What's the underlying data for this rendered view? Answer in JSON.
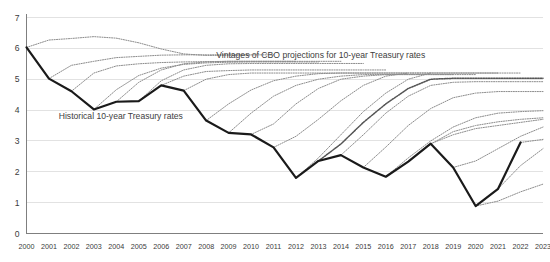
{
  "chart_data": {
    "type": "line",
    "title": "",
    "xlabel": "",
    "ylabel": "",
    "grid": true,
    "legend_position": "inline-annotations",
    "xlim": [
      2000,
      2023
    ],
    "ylim": [
      0,
      7
    ],
    "yticks": [
      0,
      1,
      2,
      3,
      4,
      5,
      6,
      7
    ],
    "ytick_labels": [
      "0",
      "1",
      "2",
      "3",
      "4",
      "5",
      "6",
      "7"
    ],
    "categories": [
      2000,
      2001,
      2002,
      2003,
      2004,
      2005,
      2006,
      2007,
      2008,
      2009,
      2010,
      2011,
      2012,
      2013,
      2014,
      2015,
      2016,
      2017,
      2018,
      2019,
      2020,
      2021,
      2022,
      2023
    ],
    "xtick_labels": [
      "2000",
      "2001",
      "2002",
      "2003",
      "2004",
      "2005",
      "2006",
      "2007",
      "2008",
      "2009",
      "2010",
      "2011",
      "2012",
      "2013",
      "2014",
      "2015",
      "2016",
      "2017",
      "2018",
      "2019",
      "2020",
      "2021",
      "2022",
      "2023"
    ],
    "annotations": [
      {
        "name": "historical-label",
        "text": "Historical 10-year Treasury rates",
        "x": 2004.2,
        "y": 3.72
      },
      {
        "name": "projections-label",
        "text": "Vintages of CBO projections for 10-year Treasury rates",
        "x": 2013.1,
        "y": 5.68
      }
    ],
    "series": [
      {
        "name": "Historical 10-year Treasury rates",
        "style": "solid",
        "color": "#1a1a1a",
        "x": [
          2000,
          2001,
          2002,
          2003,
          2004,
          2005,
          2006,
          2007,
          2008,
          2009,
          2010,
          2011,
          2012,
          2013,
          2014,
          2015,
          2016,
          2017,
          2018,
          2019,
          2020,
          2021,
          2022
        ],
        "values": [
          6.03,
          5.02,
          4.61,
          4.02,
          4.27,
          4.29,
          4.8,
          4.63,
          3.66,
          3.26,
          3.21,
          2.79,
          1.8,
          2.35,
          2.54,
          2.14,
          1.84,
          2.33,
          2.91,
          2.14,
          0.89,
          1.45,
          2.95
        ]
      },
      {
        "name": "CBO projection vintage 2000",
        "style": "dotted",
        "x": [
          2000,
          2001,
          2002,
          2003,
          2004,
          2005,
          2006,
          2007,
          2008,
          2009,
          2010
        ],
        "values": [
          6.03,
          6.27,
          6.32,
          6.38,
          6.33,
          6.18,
          5.98,
          5.82,
          5.77,
          5.78,
          5.78
        ]
      },
      {
        "name": "CBO projection vintage 2001",
        "style": "dotted",
        "x": [
          2001,
          2002,
          2003,
          2004,
          2005,
          2006,
          2007,
          2008,
          2009,
          2010,
          2011
        ],
        "values": [
          5.02,
          5.45,
          5.58,
          5.7,
          5.74,
          5.78,
          5.79,
          5.79,
          5.79,
          5.79,
          5.79
        ]
      },
      {
        "name": "CBO projection vintage 2002",
        "style": "dotted",
        "x": [
          2002,
          2003,
          2004,
          2005,
          2006,
          2007,
          2008,
          2009,
          2010,
          2011,
          2012
        ],
        "values": [
          4.61,
          5.2,
          5.43,
          5.5,
          5.54,
          5.56,
          5.57,
          5.58,
          5.58,
          5.58,
          5.58
        ]
      },
      {
        "name": "CBO projection vintage 2003",
        "style": "dotted",
        "x": [
          2003,
          2004,
          2005,
          2006,
          2007,
          2008,
          2009,
          2010,
          2011,
          2012,
          2013
        ],
        "values": [
          4.02,
          4.66,
          5.12,
          5.36,
          5.48,
          5.53,
          5.55,
          5.56,
          5.56,
          5.56,
          5.56
        ]
      },
      {
        "name": "CBO projection vintage 2004",
        "style": "dotted",
        "x": [
          2004,
          2005,
          2006,
          2007,
          2008,
          2009,
          2010,
          2011,
          2012,
          2013,
          2014
        ],
        "values": [
          4.27,
          4.9,
          5.3,
          5.5,
          5.56,
          5.58,
          5.58,
          5.58,
          5.58,
          5.58,
          5.58
        ]
      },
      {
        "name": "CBO projection vintage 2005",
        "style": "dotted",
        "x": [
          2005,
          2006,
          2007,
          2008,
          2009,
          2010,
          2011,
          2012,
          2013,
          2014,
          2015
        ],
        "values": [
          4.29,
          4.95,
          5.3,
          5.45,
          5.5,
          5.51,
          5.51,
          5.51,
          5.51,
          5.51,
          5.51
        ]
      },
      {
        "name": "CBO projection vintage 2006",
        "style": "dotted",
        "x": [
          2006,
          2007,
          2008,
          2009,
          2010,
          2011,
          2012,
          2013,
          2014,
          2015,
          2016
        ],
        "values": [
          4.8,
          5.1,
          5.25,
          5.28,
          5.3,
          5.3,
          5.3,
          5.3,
          5.3,
          5.3,
          5.3
        ]
      },
      {
        "name": "CBO projection vintage 2007",
        "style": "dotted",
        "x": [
          2007,
          2008,
          2009,
          2010,
          2011,
          2012,
          2013,
          2014,
          2015,
          2016,
          2017
        ],
        "values": [
          4.63,
          5.0,
          5.15,
          5.2,
          5.2,
          5.2,
          5.2,
          5.2,
          5.2,
          5.2,
          5.2
        ]
      },
      {
        "name": "CBO projection vintage 2008",
        "style": "dotted",
        "x": [
          2008,
          2009,
          2010,
          2011,
          2012,
          2013,
          2014,
          2015,
          2016,
          2017,
          2018
        ],
        "values": [
          3.66,
          4.2,
          4.65,
          4.95,
          5.1,
          5.18,
          5.2,
          5.2,
          5.2,
          5.2,
          5.2
        ]
      },
      {
        "name": "CBO projection vintage 2009",
        "style": "dotted",
        "x": [
          2009,
          2010,
          2011,
          2012,
          2013,
          2014,
          2015,
          2016,
          2017,
          2018,
          2019
        ],
        "values": [
          3.26,
          3.9,
          4.45,
          4.8,
          5.0,
          5.1,
          5.15,
          5.15,
          5.15,
          5.15,
          5.15
        ]
      },
      {
        "name": "CBO projection vintage 2010",
        "style": "dotted",
        "x": [
          2010,
          2011,
          2012,
          2013,
          2014,
          2015,
          2016,
          2017,
          2018,
          2019,
          2020
        ],
        "values": [
          3.21,
          3.55,
          4.2,
          4.7,
          5.0,
          5.1,
          5.15,
          5.15,
          5.15,
          5.15,
          5.15
        ]
      },
      {
        "name": "CBO projection vintage 2011",
        "style": "dotted",
        "x": [
          2011,
          2012,
          2013,
          2014,
          2015,
          2016,
          2017,
          2018,
          2019,
          2020,
          2021
        ],
        "values": [
          2.79,
          3.15,
          3.7,
          4.3,
          4.8,
          5.1,
          5.2,
          5.2,
          5.2,
          5.2,
          5.2
        ]
      },
      {
        "name": "CBO projection vintage 2012",
        "style": "dotted",
        "x": [
          2012,
          2013,
          2014,
          2015,
          2016,
          2017,
          2018,
          2019,
          2020,
          2021,
          2022
        ],
        "values": [
          1.8,
          2.45,
          3.2,
          3.95,
          4.55,
          5.0,
          5.2,
          5.2,
          5.2,
          5.2,
          5.2
        ]
      },
      {
        "name": "CBO projection vintage 2013",
        "style": "dotted-dark",
        "x": [
          2013,
          2014,
          2015,
          2016,
          2017,
          2018,
          2019,
          2020,
          2021,
          2022,
          2023
        ],
        "values": [
          2.35,
          2.9,
          3.6,
          4.2,
          4.7,
          5.0,
          5.03,
          5.03,
          5.03,
          5.03,
          5.03
        ]
      },
      {
        "name": "CBO projection vintage 2014",
        "style": "dotted",
        "x": [
          2014,
          2015,
          2016,
          2017,
          2018,
          2019,
          2020,
          2021,
          2022,
          2023
        ],
        "values": [
          2.54,
          3.2,
          3.9,
          4.45,
          4.8,
          4.9,
          4.92,
          4.92,
          4.92,
          4.92
        ]
      },
      {
        "name": "CBO projection vintage 2015",
        "style": "dotted",
        "x": [
          2015,
          2016,
          2017,
          2018,
          2019,
          2020,
          2021,
          2022,
          2023
        ],
        "values": [
          2.14,
          2.8,
          3.5,
          4.05,
          4.4,
          4.55,
          4.6,
          4.6,
          4.6
        ]
      },
      {
        "name": "CBO projection vintage 2016",
        "style": "dotted",
        "x": [
          2016,
          2017,
          2018,
          2019,
          2020,
          2021,
          2022,
          2023
        ],
        "values": [
          1.84,
          2.45,
          3.0,
          3.45,
          3.75,
          3.9,
          3.95,
          3.98
        ]
      },
      {
        "name": "CBO projection vintage 2017",
        "style": "dotted",
        "x": [
          2017,
          2018,
          2019,
          2020,
          2021,
          2022,
          2023
        ],
        "values": [
          2.33,
          2.9,
          3.3,
          3.5,
          3.62,
          3.7,
          3.75
        ]
      },
      {
        "name": "CBO projection vintage 2018",
        "style": "dotted",
        "x": [
          2018,
          2019,
          2020,
          2021,
          2022,
          2023
        ],
        "values": [
          2.91,
          3.2,
          3.4,
          3.5,
          3.6,
          3.7
        ]
      },
      {
        "name": "CBO projection vintage 2019",
        "style": "dotted",
        "x": [
          2019,
          2020,
          2021,
          2022,
          2023
        ],
        "values": [
          2.14,
          2.35,
          2.75,
          3.15,
          3.45
        ]
      },
      {
        "name": "CBO projection vintage 2020",
        "style": "dotted",
        "x": [
          2020,
          2021,
          2022,
          2023
        ],
        "values": [
          0.89,
          1.05,
          1.35,
          1.6
        ]
      },
      {
        "name": "CBO projection vintage 2021",
        "style": "dotted",
        "x": [
          2021,
          2022,
          2023
        ],
        "values": [
          1.45,
          2.2,
          2.75
        ]
      },
      {
        "name": "CBO projection vintage 2022",
        "style": "dotted",
        "x": [
          2022,
          2023
        ],
        "values": [
          2.95,
          3.05
        ]
      }
    ]
  }
}
